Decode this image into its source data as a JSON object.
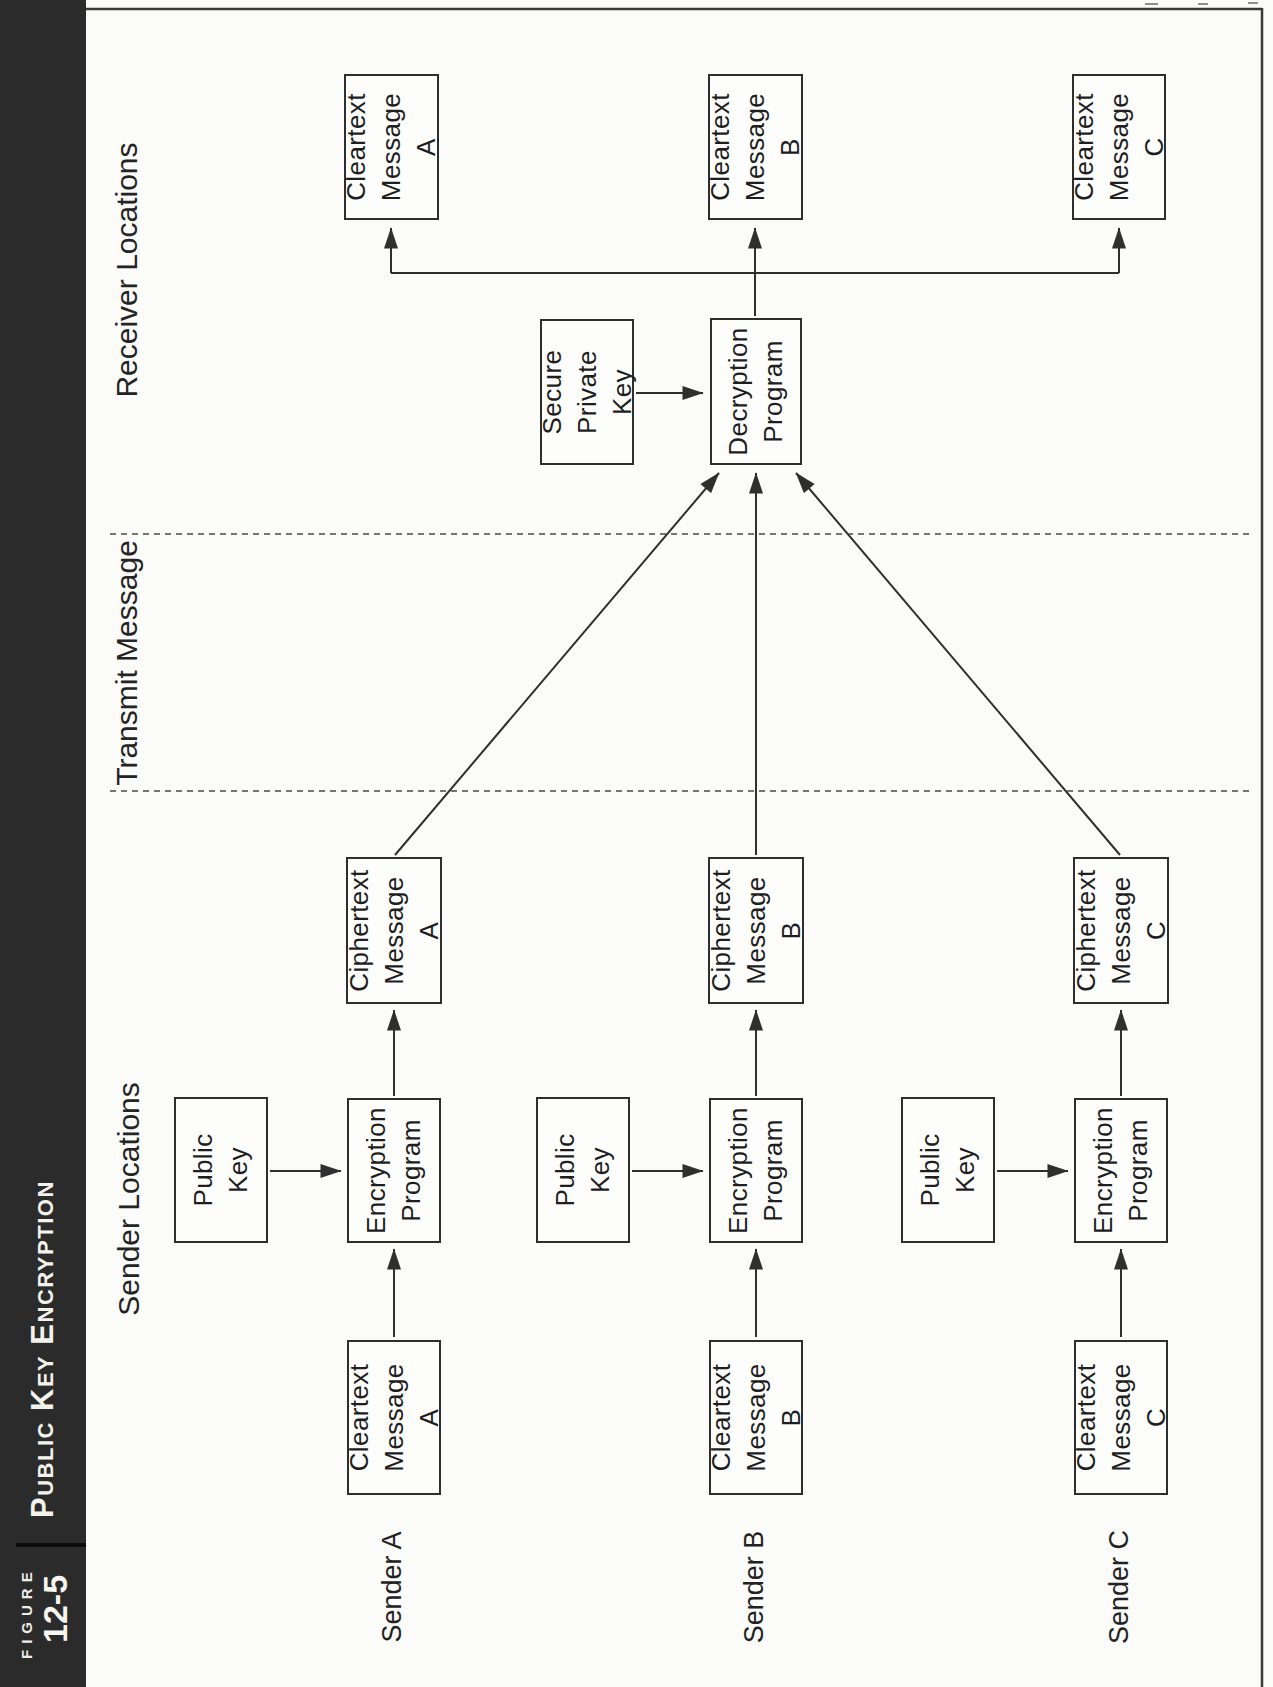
{
  "figure": {
    "eyebrow": "FIGURE",
    "number": "12-5",
    "title": "Public Key Encryption"
  },
  "sections": {
    "sender": "Sender Locations",
    "transmit": "Transmit Message",
    "receiver": "Receiver Locations"
  },
  "senders": [
    {
      "label": "Sender A",
      "cleartext": "Cleartext\nMessage\nA",
      "public_key": "Public\nKey",
      "encryption": "Encryption\nProgram",
      "ciphertext": "Ciphertext\nMessage\nA"
    },
    {
      "label": "Sender B",
      "cleartext": "Cleartext\nMessage\nB",
      "public_key": "Public\nKey",
      "encryption": "Encryption\nProgram",
      "ciphertext": "Ciphertext\nMessage\nB"
    },
    {
      "label": "Sender C",
      "cleartext": "Cleartext\nMessage\nC",
      "public_key": "Public\nKey",
      "encryption": "Encryption\nProgram",
      "ciphertext": "Ciphertext\nMessage\nC"
    }
  ],
  "receiver": {
    "secure_key": "Secure\nPrivate\nKey",
    "decryption": "Decryption\nProgram",
    "outputs": [
      "Cleartext\nMessage\nA",
      "Cleartext\nMessage\nB",
      "Cleartext\nMessage\nC"
    ]
  },
  "colors": {
    "bar_background": "#2b2b2b",
    "bar_text": "#f3f2ec",
    "line": "#2f2f2f",
    "text": "#1e1e1e",
    "paper": "#fbfbf9"
  }
}
